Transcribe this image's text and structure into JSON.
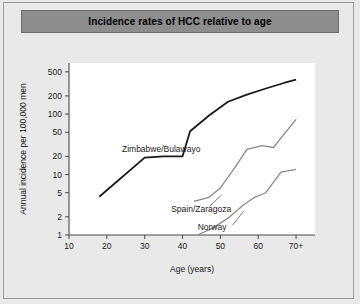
{
  "figure": {
    "title": "Incidence rates of HCC relative to age",
    "background_color": "#e9e9e9",
    "title_bar_color": "#8d8d8d",
    "plot_background_color": "#ffffff"
  },
  "chart_data": {
    "type": "line",
    "title": "Incidence rates of HCC relative to age",
    "xlabel": "Age (years)",
    "ylabel": "Annual incidence per 100,000 men",
    "yscale": "log",
    "ylim": [
      1,
      700
    ],
    "xlim": [
      10,
      75
    ],
    "grid": false,
    "legend": "inline-labels",
    "ytick_labels": [
      "500",
      "200",
      "100",
      "50",
      "20",
      "10",
      "5",
      "2",
      "1"
    ],
    "ytick_values": [
      500,
      200,
      100,
      50,
      20,
      10,
      5,
      2,
      1
    ],
    "xtick_labels": [
      "10",
      "20",
      "30",
      "40",
      "50",
      "60",
      "70+"
    ],
    "xtick_values": [
      10,
      20,
      30,
      40,
      50,
      60,
      70
    ],
    "series": [
      {
        "name": "Zimbabwe/Bulawayo",
        "color": "#1a1a1a",
        "width": 1.8,
        "label_x": 24,
        "label_y": 26,
        "x": [
          18,
          30,
          35,
          40,
          42,
          47,
          52,
          57,
          62,
          67,
          70
        ],
        "values": [
          4.3,
          19,
          20,
          20,
          52,
          95,
          160,
          210,
          265,
          330,
          370
        ]
      },
      {
        "name": "Spain/Zaragoza",
        "color": "#8a8a8a",
        "width": 1.3,
        "label_x": 37,
        "label_y": 2.7,
        "x": [
          43,
          47,
          50,
          54,
          57,
          61,
          64,
          67,
          70
        ],
        "values": [
          3.6,
          4.2,
          6.0,
          13.5,
          26,
          30,
          28,
          48,
          82
        ]
      },
      {
        "name": "Norway",
        "color": "#8a8a8a",
        "width": 1.3,
        "label_x": 44,
        "label_y": 1.35,
        "x": [
          44,
          48,
          52,
          56,
          59,
          62,
          66,
          70
        ],
        "values": [
          1.0,
          1.3,
          1.9,
          3.1,
          4.2,
          5.0,
          11.0,
          12.2
        ]
      }
    ]
  }
}
